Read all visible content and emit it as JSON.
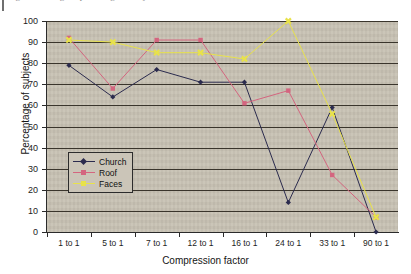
{
  "scan": {
    "partial_top_caption": "Figure showing the percentage of subjects",
    "background_color": "#c8c2b4",
    "gridline_color": "#3a352c"
  },
  "chart_data": {
    "type": "line",
    "title": "",
    "xlabel": "Compression factor",
    "ylabel": "Percentage of subjects",
    "categories": [
      "1 to 1",
      "5 to 1",
      "7 to 1",
      "12 to 1",
      "16 to 1",
      "24 to 1",
      "33 to 1",
      "90 to 1"
    ],
    "ylim": [
      0,
      100
    ],
    "yticks": [
      0,
      10,
      20,
      30,
      40,
      50,
      60,
      70,
      80,
      90,
      100
    ],
    "grid": true,
    "legend_position": "inside-lower-left",
    "series": [
      {
        "name": "Church",
        "color": "#2b2b4e",
        "marker": "diamond",
        "values": [
          79,
          64,
          77,
          71,
          71,
          14,
          59,
          0
        ]
      },
      {
        "name": "Roof",
        "color": "#d4657f",
        "marker": "square",
        "values": [
          92,
          68,
          91,
          91,
          61,
          67,
          27,
          7
        ]
      },
      {
        "name": "Faces",
        "color": "#e8e24a",
        "marker": "cross",
        "values": [
          91,
          90,
          85,
          85,
          82,
          100,
          56,
          7
        ]
      }
    ]
  },
  "axes": {
    "y_tick_labels": [
      "100",
      "90",
      "80",
      "70",
      "60",
      "50",
      "40",
      "30",
      "20",
      "10",
      "0"
    ],
    "y_title": "Percentage of subjects",
    "x_title": "Compression factor",
    "x_tick_labels": [
      "1 to 1",
      "5 to 1",
      "7 to 1",
      "12 to 1",
      "16 to 1",
      "24 to 1",
      "33 to 1",
      "90 to 1"
    ]
  },
  "legend": {
    "items": [
      {
        "label": "Church",
        "color": "#2b2b4e"
      },
      {
        "label": "Roof",
        "color": "#d4657f"
      },
      {
        "label": "Faces",
        "color": "#e8e24a"
      }
    ]
  }
}
